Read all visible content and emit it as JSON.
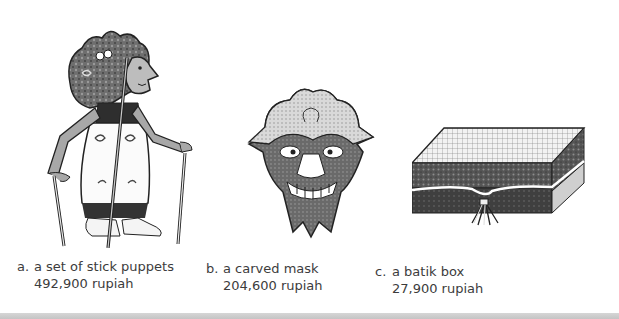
{
  "items": [
    {
      "letter": "a.",
      "name": "a set of stick puppets",
      "price": "492,900 rupiah",
      "icon": "stick-puppet-illustration"
    },
    {
      "letter": "b.",
      "name": "a carved mask",
      "price": "204,600 rupiah",
      "icon": "carved-mask-illustration"
    },
    {
      "letter": "c.",
      "name": "a batik box",
      "price": "27,900 rupiah",
      "icon": "batik-box-illustration"
    }
  ],
  "colors": {
    "ink": "#2b2b2b",
    "shade": "#7a7a7a",
    "light": "#bdbdbd",
    "band": "#cccccc"
  }
}
